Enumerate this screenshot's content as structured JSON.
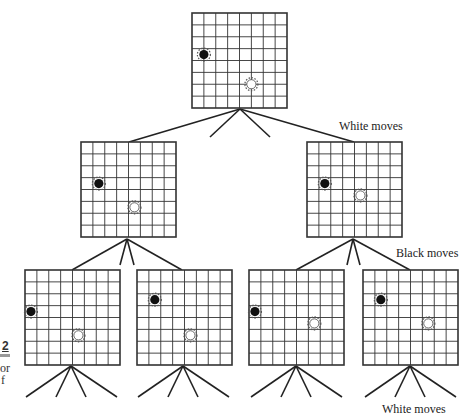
{
  "figure": {
    "type": "game-tree",
    "grid_size": 8,
    "labels": {
      "level1": "White moves",
      "level2": "Black moves",
      "level3": "White moves"
    },
    "left_fragments": {
      "number": "2",
      "line1": "or",
      "line2": "f"
    },
    "colors": {
      "line": "#222222",
      "grid": "#333333",
      "black_stone": "#111111",
      "white_stone": "#ffffff"
    },
    "boards": [
      {
        "id": "root",
        "x": 192,
        "y": 13,
        "black": [
          1,
          3.5
        ],
        "white": [
          5,
          6
        ]
      },
      {
        "id": "child-left",
        "x": 81,
        "y": 142,
        "black": [
          1.5,
          3.5
        ],
        "white": [
          4.5,
          5.5
        ]
      },
      {
        "id": "child-right",
        "x": 307,
        "y": 142,
        "black": [
          1.5,
          3.5
        ],
        "white": [
          4.5,
          4.5
        ]
      },
      {
        "id": "grandchild-1",
        "x": 25,
        "y": 270,
        "black": [
          0.5,
          3.5
        ],
        "white": [
          4.5,
          5.5
        ]
      },
      {
        "id": "grandchild-2",
        "x": 137,
        "y": 270,
        "black": [
          1.5,
          2.5
        ],
        "white": [
          4.5,
          5.5
        ]
      },
      {
        "id": "grandchild-3",
        "x": 249,
        "y": 270,
        "black": [
          0.5,
          3.5
        ],
        "white": [
          5.5,
          4.5
        ]
      },
      {
        "id": "grandchild-4",
        "x": 363,
        "y": 270,
        "black": [
          1.5,
          2.5
        ],
        "white": [
          5.5,
          4.5
        ]
      }
    ],
    "edges": [
      [
        240,
        109,
        129,
        142
      ],
      [
        240,
        109,
        354,
        142
      ],
      [
        240,
        109,
        210,
        137
      ],
      [
        240,
        109,
        270,
        137
      ],
      [
        127,
        239,
        72,
        270
      ],
      [
        127,
        239,
        182,
        270
      ],
      [
        127,
        239,
        120,
        265
      ],
      [
        127,
        239,
        134,
        265
      ],
      [
        353,
        239,
        296,
        270
      ],
      [
        353,
        239,
        410,
        270
      ],
      [
        353,
        239,
        347,
        265
      ],
      [
        353,
        239,
        360,
        265
      ],
      [
        71,
        366,
        26,
        397
      ],
      [
        71,
        366,
        56,
        397
      ],
      [
        71,
        366,
        86,
        397
      ],
      [
        71,
        366,
        117,
        397
      ],
      [
        183,
        366,
        138,
        397
      ],
      [
        183,
        366,
        168,
        397
      ],
      [
        183,
        366,
        198,
        397
      ],
      [
        183,
        366,
        229,
        397
      ],
      [
        296,
        366,
        251,
        397
      ],
      [
        296,
        366,
        281,
        397
      ],
      [
        296,
        366,
        311,
        397
      ],
      [
        296,
        366,
        342,
        397
      ],
      [
        410,
        366,
        365,
        397
      ],
      [
        410,
        366,
        395,
        397
      ],
      [
        410,
        366,
        425,
        397
      ],
      [
        410,
        366,
        456,
        397
      ]
    ]
  }
}
